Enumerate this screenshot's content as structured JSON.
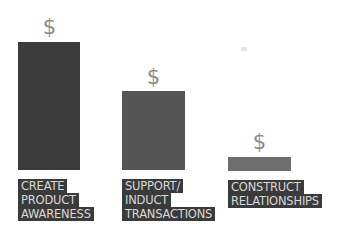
{
  "diagram": {
    "symbol": "$",
    "colors": {
      "bar_1": "#3b3b3b",
      "bar_2": "#555555",
      "bar_3": "#6e6e6e",
      "label_bg": "#3a3a3a",
      "label_text": "#d8d8d8",
      "symbol": "#8a8a8a"
    },
    "columns": [
      {
        "symbol": "$",
        "label_lines": [
          "CREATE",
          "PRODUCT",
          "AWARENESS"
        ],
        "relative_height": 128
      },
      {
        "symbol": "$",
        "label_lines": [
          "SUPPORT/",
          "INDUCT",
          "TRANSACTIONS"
        ],
        "relative_height": 79
      },
      {
        "symbol": "$",
        "label_lines": [
          "CONSTRUCT",
          "RELATIONSHIPS"
        ],
        "relative_height": 14
      }
    ]
  }
}
